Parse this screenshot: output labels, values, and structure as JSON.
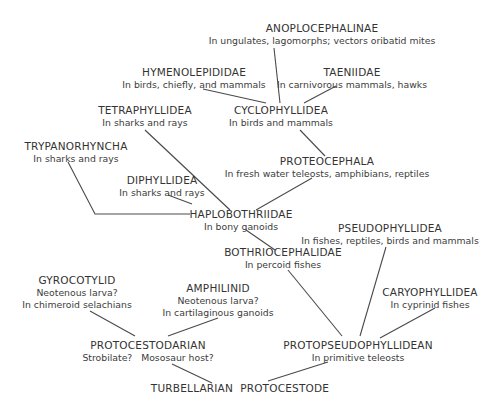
{
  "diagram": {
    "type": "phylogenetic-tree",
    "root": "turbellarian_protocestode",
    "nodes": {
      "anoplocephalinae": {
        "name": "ANOPLOCEPHALINAE",
        "lines": [
          "In ungulates, lagomorphs; vectors oribatid mites"
        ]
      },
      "hymenolepididae": {
        "name": "HYMENOLEPIDIDAE",
        "lines": [
          "In birds, chiefly, and mammals"
        ]
      },
      "taeniidae": {
        "name": "TAENIIDAE",
        "lines": [
          "In carnivorous mammals, hawks"
        ]
      },
      "tetraphyllidea": {
        "name": "TETRAPHYLLIDEA",
        "lines": [
          "In sharks and rays"
        ]
      },
      "cyclophyllidea": {
        "name": "CYCLOPHYLLIDEA",
        "lines": [
          "In birds and mammals"
        ]
      },
      "trypanorhyncha": {
        "name": "TRYPANORHYNCHA",
        "lines": [
          "In sharks and rays"
        ]
      },
      "proteocephala": {
        "name": "PROTEOCEPHALA",
        "lines": [
          "In fresh water teleosts, amphibians, reptiles"
        ]
      },
      "diphyllidea": {
        "name": "DIPHYLLIDEA",
        "lines": [
          "In sharks and rays"
        ]
      },
      "haplobothriidae": {
        "name": "HAPLOBOTHRIIDAE",
        "lines": [
          "In bony ganoids"
        ]
      },
      "pseudophyllidea": {
        "name": "PSEUDOPHYLLIDEA",
        "lines": [
          "In fishes, reptiles, birds and mammals"
        ]
      },
      "bothriocephalidae": {
        "name": "BOTHRIOCEPHALIDAE",
        "lines": [
          "In percoid fishes"
        ]
      },
      "gyrocotylid": {
        "name": "GYROCOTYLID",
        "lines": [
          "Neotenous larva?",
          "In chimeroid selachians"
        ]
      },
      "amphilinid": {
        "name": "AMPHILINID",
        "lines": [
          "Neotenous larva?",
          "In cartilaginous ganoids"
        ]
      },
      "caryophyllidea": {
        "name": "CARYOPHYLLIDEA",
        "lines": [
          "In cyprinid fishes"
        ]
      },
      "protocestodarian": {
        "name": "PROTOCESTODARIAN",
        "lines": [
          "Strobilate?   Mososaur host?"
        ]
      },
      "protopseudophyllidean": {
        "name": "PROTOPSEUDOPHYLLIDEAN",
        "lines": [
          "In primitive teleosts"
        ]
      },
      "turbellarian_protocestode": {
        "name": "TURBELLARIAN  PROTOCESTODE",
        "lines": []
      }
    },
    "edges": [
      [
        "turbellarian_protocestode",
        "protocestodarian"
      ],
      [
        "turbellarian_protocestode",
        "protopseudophyllidean"
      ],
      [
        "protocestodarian",
        "gyrocotylid"
      ],
      [
        "protocestodarian",
        "amphilinid"
      ],
      [
        "protopseudophyllidean",
        "bothriocephalidae"
      ],
      [
        "protopseudophyllidean",
        "pseudophyllidea"
      ],
      [
        "protopseudophyllidean",
        "caryophyllidea"
      ],
      [
        "bothriocephalidae",
        "haplobothriidae"
      ],
      [
        "haplobothriidae",
        "trypanorhyncha"
      ],
      [
        "haplobothriidae",
        "diphyllidea"
      ],
      [
        "haplobothriidae",
        "tetraphyllidea"
      ],
      [
        "haplobothriidae",
        "proteocephala"
      ],
      [
        "proteocephala",
        "cyclophyllidea"
      ],
      [
        "cyclophyllidea",
        "hymenolepididae"
      ],
      [
        "cyclophyllidea",
        "anoplocephalinae"
      ],
      [
        "cyclophyllidea",
        "taeniidae"
      ]
    ]
  }
}
